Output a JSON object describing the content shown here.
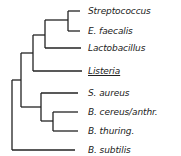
{
  "diagram": {
    "type": "phylogenetic-tree",
    "line_color": "#222222",
    "leaves": [
      {
        "label": "Streptococcus",
        "y": 11,
        "x_start": 68,
        "underline": false
      },
      {
        "label": "E. faecalis",
        "y": 31,
        "x_start": 68,
        "underline": false
      },
      {
        "label": "Lactobacillus",
        "y": 48,
        "x_start": 45,
        "underline": false
      },
      {
        "label": "Listeria",
        "y": 71,
        "x_start": 33,
        "underline": true
      },
      {
        "label": "S. aureus",
        "y": 93,
        "x_start": 41,
        "underline": false
      },
      {
        "label": "B. cereus/anthr.",
        "y": 112,
        "x_start": 53,
        "underline": false
      },
      {
        "label": "B. thuring.",
        "y": 131,
        "x_start": 53,
        "underline": false
      },
      {
        "label": "B. subtilis",
        "y": 150,
        "x_start": 12,
        "underline": false
      }
    ]
  }
}
